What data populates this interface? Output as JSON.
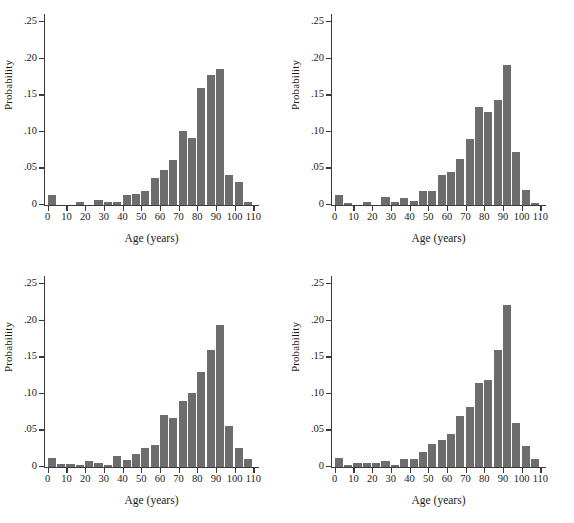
{
  "figure": {
    "background": "#ffffff",
    "bar_color": "#6d6d6d",
    "axis_color": "#3a3a3a",
    "panel_count": 4
  },
  "axes": {
    "ylabel": "Probability",
    "xlabel": "Age (years)",
    "ytick_labels": [
      "0",
      ".05",
      ".10",
      ".15",
      ".20",
      ".25"
    ],
    "ytick_values": [
      0,
      0.05,
      0.1,
      0.15,
      0.2,
      0.25
    ],
    "xtick_labels": [
      "0",
      "10",
      "20",
      "30",
      "40",
      "50",
      "60",
      "70",
      "80",
      "90",
      "100",
      "110"
    ],
    "xtick_values": [
      0,
      10,
      20,
      30,
      40,
      50,
      60,
      70,
      80,
      90,
      100,
      110
    ],
    "xlim": [
      -2,
      113
    ],
    "ylim": [
      0,
      0.26
    ]
  },
  "chart_data": [
    {
      "type": "bar",
      "panel": "top-left",
      "title": "",
      "xlabel": "Age (years)",
      "ylabel": "Probability",
      "xlim": [
        -2,
        113
      ],
      "ylim": [
        0,
        0.26
      ],
      "grid": false,
      "bin_width": 5,
      "categories": [
        "0-5",
        "5-10",
        "10-15",
        "15-20",
        "20-25",
        "25-30",
        "30-35",
        "35-40",
        "40-45",
        "45-50",
        "50-55",
        "55-60",
        "60-65",
        "65-70",
        "70-75",
        "75-80",
        "80-85",
        "85-90",
        "90-95",
        "95-100",
        "100-105",
        "105-110"
      ],
      "x": [
        2.5,
        7.5,
        12.5,
        17.5,
        22.5,
        27.5,
        32.5,
        37.5,
        42.5,
        47.5,
        52.5,
        57.5,
        62.5,
        67.5,
        72.5,
        77.5,
        82.5,
        87.5,
        92.5,
        97.5,
        102.5,
        107.5
      ],
      "values": [
        0.013,
        0.0,
        0.0,
        0.003,
        0.0,
        0.006,
        0.003,
        0.003,
        0.013,
        0.015,
        0.019,
        0.037,
        0.047,
        0.061,
        0.101,
        0.091,
        0.16,
        0.178,
        0.185,
        0.041,
        0.031,
        0.004
      ]
    },
    {
      "type": "bar",
      "panel": "top-right",
      "title": "",
      "xlabel": "Age (years)",
      "ylabel": "Probability",
      "xlim": [
        -2,
        113
      ],
      "ylim": [
        0,
        0.26
      ],
      "grid": false,
      "bin_width": 5,
      "categories": [
        "0-5",
        "5-10",
        "10-15",
        "15-20",
        "20-25",
        "25-30",
        "30-35",
        "35-40",
        "40-45",
        "45-50",
        "50-55",
        "55-60",
        "60-65",
        "65-70",
        "70-75",
        "75-80",
        "80-85",
        "85-90",
        "90-95",
        "95-100",
        "100-105",
        "105-110"
      ],
      "x": [
        2.5,
        7.5,
        12.5,
        17.5,
        22.5,
        27.5,
        32.5,
        37.5,
        42.5,
        47.5,
        52.5,
        57.5,
        62.5,
        67.5,
        72.5,
        77.5,
        82.5,
        87.5,
        92.5,
        97.5,
        102.5,
        107.5
      ],
      "values": [
        0.013,
        0.001,
        0.0,
        0.004,
        0.0,
        0.011,
        0.003,
        0.009,
        0.005,
        0.019,
        0.019,
        0.041,
        0.044,
        0.062,
        0.09,
        0.133,
        0.127,
        0.143,
        0.191,
        0.072,
        0.02,
        0.002
      ]
    },
    {
      "type": "bar",
      "panel": "bottom-left",
      "title": "",
      "xlabel": "Age (years)",
      "ylabel": "Probability",
      "xlim": [
        -2,
        113
      ],
      "ylim": [
        0,
        0.26
      ],
      "grid": false,
      "bin_width": 5,
      "categories": [
        "0-5",
        "5-10",
        "10-15",
        "15-20",
        "20-25",
        "25-30",
        "30-35",
        "35-40",
        "40-45",
        "45-50",
        "50-55",
        "55-60",
        "60-65",
        "65-70",
        "70-75",
        "75-80",
        "80-85",
        "85-90",
        "90-95",
        "95-100",
        "100-105",
        "105-110"
      ],
      "x": [
        2.5,
        7.5,
        12.5,
        17.5,
        22.5,
        27.5,
        32.5,
        37.5,
        42.5,
        47.5,
        52.5,
        57.5,
        62.5,
        67.5,
        72.5,
        77.5,
        82.5,
        87.5,
        92.5,
        97.5,
        102.5,
        107.5
      ],
      "values": [
        0.012,
        0.003,
        0.003,
        0.001,
        0.008,
        0.005,
        0.002,
        0.015,
        0.009,
        0.017,
        0.025,
        0.03,
        0.07,
        0.066,
        0.09,
        0.101,
        0.13,
        0.16,
        0.194,
        0.055,
        0.026,
        0.01
      ]
    },
    {
      "type": "bar",
      "panel": "bottom-right",
      "title": "",
      "xlabel": "Age (years)",
      "ylabel": "Probability",
      "xlim": [
        -2,
        113
      ],
      "ylim": [
        0,
        0.26
      ],
      "grid": false,
      "bin_width": 5,
      "categories": [
        "0-5",
        "5-10",
        "10-15",
        "15-20",
        "20-25",
        "25-30",
        "30-35",
        "35-40",
        "40-45",
        "45-50",
        "50-55",
        "55-60",
        "60-65",
        "65-70",
        "70-75",
        "75-80",
        "80-85",
        "85-90",
        "90-95",
        "95-100",
        "100-105",
        "105-110"
      ],
      "x": [
        2.5,
        7.5,
        12.5,
        17.5,
        22.5,
        27.5,
        32.5,
        37.5,
        42.5,
        47.5,
        52.5,
        57.5,
        62.5,
        67.5,
        72.5,
        77.5,
        82.5,
        87.5,
        92.5,
        97.5,
        102.5,
        107.5
      ],
      "values": [
        0.012,
        0.001,
        0.005,
        0.005,
        0.005,
        0.008,
        0.001,
        0.011,
        0.01,
        0.02,
        0.031,
        0.036,
        0.044,
        0.069,
        0.081,
        0.114,
        0.118,
        0.16,
        0.221,
        0.06,
        0.028,
        0.01
      ]
    }
  ]
}
